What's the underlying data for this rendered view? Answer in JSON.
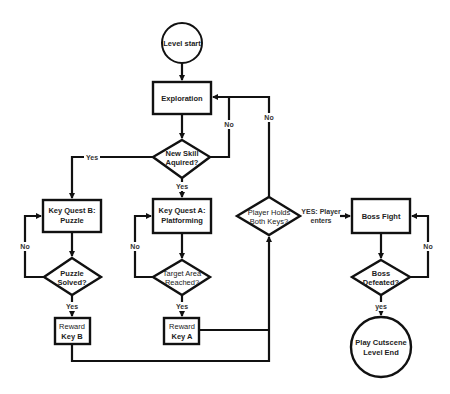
{
  "diagram": {
    "type": "flowchart",
    "nodes": {
      "start": {
        "shape": "circle",
        "label": "Level start"
      },
      "exploration": {
        "shape": "rect",
        "label": "Exploration"
      },
      "new_skill": {
        "shape": "diamond",
        "line1": "New Skill",
        "line2": "Aquired?"
      },
      "quest_b": {
        "shape": "rect",
        "line1": "Key Quest B:",
        "line2": "Puzzle"
      },
      "puzzle_solved": {
        "shape": "diamond",
        "line1": "Puzzle",
        "line2": "Solved?"
      },
      "reward_b": {
        "shape": "rect",
        "line1": "Reward",
        "line2": "Key B"
      },
      "quest_a": {
        "shape": "rect",
        "line1": "Key Quest A:",
        "line2": "Platforming"
      },
      "target_area": {
        "shape": "diamond",
        "line1": "Target Area",
        "line2": "Reached?"
      },
      "reward_a": {
        "shape": "rect",
        "line1": "Reward",
        "line2": "Key A"
      },
      "holds_keys": {
        "shape": "diamond",
        "line1": "Player Holds",
        "line2": "Both Keys?"
      },
      "boss_fight": {
        "shape": "rect",
        "label": "Boss Fight"
      },
      "boss_defeated": {
        "shape": "diamond",
        "line1": "Boss",
        "line2": "Defeated?"
      },
      "end": {
        "shape": "circle",
        "line1": "Play Cutscene",
        "line2": "Level End"
      }
    },
    "edge_labels": {
      "skill_no": "No",
      "keys_no": "No",
      "skill_yes_left": "Yes",
      "skill_yes_down": "Yes",
      "puzzle_no": "No",
      "puzzle_yes": "Yes",
      "target_no": "No",
      "target_yes": "Yes",
      "keys_yes_line1": "YES: Player",
      "keys_yes_line2": "enters",
      "boss_no": "No",
      "boss_yes": "yes"
    }
  }
}
